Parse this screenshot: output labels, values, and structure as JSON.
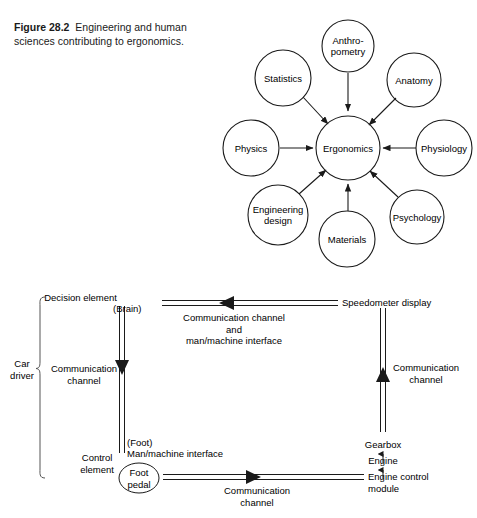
{
  "figure": {
    "number": "Figure 28.2",
    "caption": "Engineering and human sciences contributing to ergonomics."
  },
  "diagram_ergonomics": {
    "hub": {
      "label": "Ergonomics"
    },
    "nodes": [
      {
        "label": "Anthro-\npometry",
        "line1": "Anthro-",
        "line2": "pometry"
      },
      {
        "label": "Statistics"
      },
      {
        "label": "Anatomy"
      },
      {
        "label": "Physics"
      },
      {
        "label": "Physiology"
      },
      {
        "label": "Engineering\ndesign",
        "line1": "Engineering",
        "line2": "design"
      },
      {
        "label": "Materials"
      },
      {
        "label": "Psychology"
      }
    ]
  },
  "diagram_control_loop": {
    "brace_label_line1": "Car",
    "brace_label_line2": "driver",
    "decision_element_line1": "Decision element",
    "decision_element_line2": "(Brain)",
    "left_channel_line1": "Communication",
    "left_channel_line2": "channel",
    "control_element_line1": "Control",
    "control_element_line2": "element",
    "foot_note": "(Foot)",
    "man_machine_interface": "Man/machine interface",
    "foot_pedal_line1": "Foot",
    "foot_pedal_line2": "pedal",
    "top_channel_line1": "Communication channel",
    "top_channel_line2": "and",
    "top_channel_line3": "man/machine interface",
    "speedometer_display": "Speedometer display",
    "right_channel_line1": "Communication",
    "right_channel_line2": "channel",
    "gearbox": "Gearbox",
    "engine": "Engine",
    "engine_control_module_line1": "Engine control",
    "engine_control_module_line2": "module",
    "bottom_channel_line1": "Communication",
    "bottom_channel_line2": "channel"
  },
  "colors": {
    "stroke": "#1a1a1a",
    "text": "#000000",
    "background": "#ffffff"
  }
}
